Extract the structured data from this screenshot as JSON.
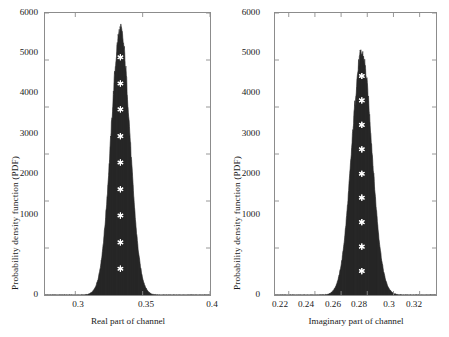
{
  "figure": {
    "background": "#ffffff",
    "axis_color": "#8c8c8c",
    "text_color": "#1a1a1a",
    "fill_color": "#2b2b2b",
    "marker_color": "#ffffff"
  },
  "panels": [
    {
      "id": "real-part",
      "ylabel": "Probability density function (PDF)",
      "xlabel": "Real part of channel",
      "ytick_labels": [
        "0",
        "1000",
        "2000",
        "3000",
        "4000",
        "5000",
        "6000"
      ],
      "xtick_labels": [
        "0.3",
        "0.35",
        "0.4"
      ]
    },
    {
      "id": "imaginary-part",
      "ylabel": "Probability density function (PDF)",
      "xlabel": "Imaginary part of channel",
      "ytick_labels": [
        "0",
        "1000",
        "2000",
        "3000",
        "4000",
        "5000",
        "6000"
      ],
      "xtick_labels": [
        "0.22",
        "0.24",
        "0.26",
        "0.28",
        "0.3",
        "0.32"
      ]
    }
  ],
  "chart_data": [
    {
      "type": "area",
      "id": "real-part-pdf",
      "title": "",
      "xlabel": "Real part of channel",
      "ylabel": "Probability density function (PDF)",
      "xlim": [
        0.2775,
        0.4
      ],
      "ylim": [
        0,
        6000
      ],
      "xticks": [
        0.3,
        0.35,
        0.4
      ],
      "yticks": [
        0,
        1000,
        2000,
        3000,
        4000,
        5000,
        6000
      ],
      "grid": false,
      "legend": "none",
      "distribution": {
        "shape": "normal",
        "mean": 0.3335,
        "sigma": 0.00705,
        "peak_value": 5620
      },
      "x": [
        0.2775,
        0.29,
        0.3,
        0.308,
        0.313,
        0.316,
        0.319,
        0.321,
        0.323,
        0.325,
        0.327,
        0.329,
        0.3305,
        0.332,
        0.3335,
        0.335,
        0.3365,
        0.338,
        0.34,
        0.342,
        0.344,
        0.346,
        0.348,
        0.351,
        0.354,
        0.358,
        0.365,
        0.375,
        0.39,
        0.4
      ],
      "y": [
        0,
        2,
        12,
        60,
        160,
        290,
        500,
        760,
        1150,
        1700,
        2450,
        3400,
        4200,
        5050,
        5620,
        5050,
        4200,
        3400,
        2450,
        1700,
        1150,
        760,
        500,
        250,
        110,
        38,
        6,
        1,
        0,
        0
      ],
      "markers": {
        "symbol": "asterisk",
        "color": "#ffffff",
        "x": [
          0.3335,
          0.3335,
          0.3335,
          0.3335,
          0.3335,
          0.3335,
          0.3335,
          0.3335,
          0.3335
        ],
        "y": [
          560,
          1120,
          1690,
          2250,
          2820,
          3380,
          3950,
          4500,
          5060
        ]
      }
    },
    {
      "type": "area",
      "id": "imaginary-part-pdf",
      "title": "",
      "xlabel": "Imaginary part of channel",
      "ylabel": "Probability density function (PDF)",
      "xlim": [
        0.2095,
        0.3325
      ],
      "ylim": [
        0,
        6000
      ],
      "xticks": [
        0.22,
        0.24,
        0.26,
        0.28,
        0.3,
        0.32
      ],
      "yticks": [
        0,
        1000,
        2000,
        3000,
        4000,
        5000,
        6000
      ],
      "grid": false,
      "legend": "none",
      "distribution": {
        "shape": "normal",
        "mean": 0.2758,
        "sigma": 0.00775,
        "peak_value": 5130
      },
      "x": [
        0.2095,
        0.222,
        0.234,
        0.243,
        0.248,
        0.252,
        0.2555,
        0.2585,
        0.261,
        0.2635,
        0.266,
        0.2685,
        0.271,
        0.2735,
        0.2758,
        0.278,
        0.2805,
        0.283,
        0.2855,
        0.288,
        0.2905,
        0.293,
        0.2955,
        0.299,
        0.303,
        0.3075,
        0.313,
        0.321,
        0.3325
      ],
      "y": [
        0,
        2,
        14,
        70,
        165,
        300,
        500,
        760,
        1120,
        1620,
        2300,
        3150,
        3980,
        4720,
        5130,
        4720,
        3980,
        3150,
        2300,
        1620,
        1120,
        760,
        500,
        250,
        100,
        32,
        7,
        1,
        0
      ],
      "markers": {
        "symbol": "asterisk",
        "color": "#ffffff",
        "x": [
          0.2758,
          0.2758,
          0.2758,
          0.2758,
          0.2758,
          0.2758,
          0.2758,
          0.2758,
          0.2758
        ],
        "y": [
          510,
          1030,
          1550,
          2070,
          2580,
          3100,
          3620,
          4140,
          4660
        ]
      }
    }
  ]
}
